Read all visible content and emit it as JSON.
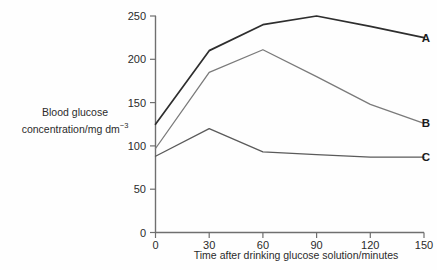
{
  "chart_data": {
    "type": "line",
    "title": "",
    "subtitle": "",
    "xlabel": "Time after drinking glucose solution/minutes",
    "ylabel_line1": "Blood glucose",
    "ylabel_line2_main": "concentration/mg dm",
    "ylabel_line2_sup": "−3",
    "x": [
      0,
      30,
      60,
      90,
      120,
      150
    ],
    "xticks": [
      "0",
      "30",
      "60",
      "90",
      "120",
      "150"
    ],
    "yticks": [
      "0",
      "50",
      "100",
      "150",
      "200",
      "250"
    ],
    "xlim": [
      0,
      150
    ],
    "ylim": [
      0,
      250
    ],
    "grid": false,
    "legend_position": "right-end-of-line",
    "series": [
      {
        "name": "A",
        "label": "A",
        "color": "#2e2e2e",
        "width": 1.7,
        "values": [
          125,
          210,
          240,
          250,
          238,
          225
        ]
      },
      {
        "name": "B",
        "label": "B",
        "color": "#7a7a7a",
        "width": 1.3,
        "values": [
          97,
          185,
          211,
          180,
          148,
          126
        ]
      },
      {
        "name": "C",
        "label": "C",
        "color": "#5a5a5a",
        "width": 1.3,
        "values": [
          88,
          120,
          93,
          90,
          87,
          87
        ]
      }
    ]
  },
  "axes": {
    "tick_color": "#6f6f6f",
    "axis_color": "#6f6f6f"
  },
  "colors": {
    "background": "#fefefe",
    "text": "#2b2b2b"
  }
}
